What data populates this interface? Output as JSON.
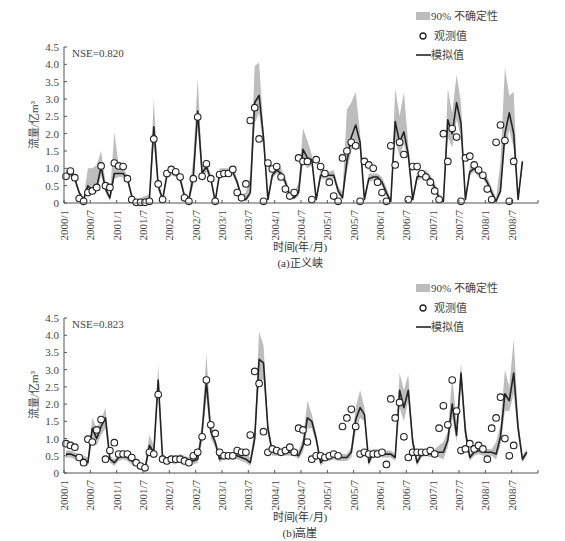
{
  "legend": {
    "band_label": "90%  不确定性",
    "observed_label": "观测值",
    "simulated_label": "模拟值"
  },
  "colors": {
    "band": "#bdbdbd",
    "line": "#222222",
    "marker_edge": "#222222",
    "marker_fill": "#ffffff",
    "axis": "#555555"
  },
  "chart_data": [
    {
      "type": "line",
      "title": "(a)正义峡",
      "caption": "(a)正义峡",
      "annotation": "NSE=0.820",
      "xlabel": "时间(年/月)",
      "ylabel": "流量/亿m³",
      "ylim": [
        0,
        4.5
      ],
      "yticks": [
        "0",
        "0.5",
        "1.0",
        "1.5",
        "2.0",
        "2.5",
        "3.0",
        "3.5",
        "4.0",
        "4.5"
      ],
      "xticks": [
        "2000/1",
        "2000/7",
        "2001/1",
        "2001/7",
        "2002/1",
        "2002/7",
        "2003/1",
        "2003/7",
        "2004/1",
        "2004/7",
        "2005/1",
        "2005/7",
        "2006/1",
        "2006/7",
        "2007/1",
        "2007/7",
        "2008/1",
        "2008/7"
      ],
      "grid": false,
      "legend_position": "top-right",
      "series": [
        {
          "name": "模拟值",
          "values": [
            0.8,
            0.85,
            0.7,
            0.3,
            0.1,
            0.5,
            0.35,
            0.45,
            1.05,
            0.4,
            0.15,
            0.85,
            0.85,
            0.85,
            0.7,
            0.2,
            0.05,
            0.05,
            0.1,
            0.1,
            2.2,
            0.5,
            0.1,
            0.8,
            0.9,
            0.85,
            0.7,
            0.2,
            0.1,
            0.75,
            2.65,
            0.85,
            1.05,
            0.7,
            0.05,
            0.85,
            0.85,
            0.85,
            0.9,
            0.6,
            0.15,
            0.1,
            0.3,
            2.9,
            3.1,
            1.9,
            0.1,
            0.8,
            0.95,
            0.85,
            0.6,
            0.2,
            0.15,
            0.3,
            1.55,
            1.3,
            1.25,
            0.1,
            0.8,
            0.8,
            0.8,
            0.8,
            0.35,
            0.15,
            1.2,
            1.9,
            2.25,
            1.75,
            0.1,
            0.7,
            0.75,
            0.75,
            0.6,
            0.3,
            0.05,
            2.35,
            1.75,
            2.05,
            1.4,
            0.1,
            0.75,
            0.8,
            0.85,
            0.7,
            0.45,
            0.15,
            0.05,
            2.4,
            2.0,
            2.9,
            2.3,
            0.1,
            0.9,
            1.0,
            0.85,
            0.8,
            0.6,
            0.3,
            0.05,
            0.35,
            2.0,
            2.6,
            2.0,
            0.1,
            1.2
          ]
        },
        {
          "name": "观测值",
          "values": [
            0.77,
            0.92,
            0.73,
            0.13,
            0.05,
            0.3,
            0.35,
            0.45,
            1.07,
            0.5,
            0.45,
            1.15,
            1.07,
            1.05,
            0.7,
            0.1,
            0.02,
            0.02,
            0.02,
            0.05,
            1.85,
            0.55,
            0.1,
            0.85,
            0.97,
            0.9,
            0.75,
            0.15,
            0.05,
            0.7,
            2.48,
            0.77,
            1.13,
            0.7,
            0.05,
            0.82,
            0.85,
            0.85,
            0.97,
            0.3,
            0.15,
            0.55,
            2.38,
            2.75,
            1.85,
            0.05,
            1.15,
            0.98,
            1.05,
            0.75,
            0.4,
            0.2,
            0.3,
            1.3,
            1.2,
            1.2,
            0.1,
            1.25,
            1.05,
            0.85,
            0.6,
            0.2,
            0.05,
            1.3,
            1.5,
            1.75,
            1.65,
            0.05,
            1.2,
            1.1,
            1.0,
            0.6,
            0.3,
            0.05,
            1.65,
            1.1,
            1.75,
            1.4,
            0.1,
            1.05,
            1.05,
            0.85,
            0.75,
            0.6,
            0.35,
            0.1,
            2.0,
            1.2,
            2.15,
            1.9,
            0.05,
            1.3,
            1.35,
            1.1,
            0.95,
            0.8,
            0.4,
            0.1,
            1.75,
            2.25,
            1.8,
            0.05,
            1.2
          ]
        },
        {
          "name": "90% 不确定性 (upper)",
          "values": [
            0.95,
            1.0,
            0.8,
            0.35,
            0.15,
            1.0,
            1.0,
            1.1,
            1.5,
            0.6,
            0.2,
            2.05,
            1.1,
            1.0,
            0.8,
            0.25,
            0.1,
            0.15,
            0.2,
            0.25,
            3.0,
            0.7,
            0.15,
            0.95,
            1.05,
            1.0,
            0.85,
            0.3,
            0.2,
            1.3,
            3.6,
            1.1,
            1.2,
            0.8,
            0.1,
            1.0,
            1.0,
            1.0,
            1.05,
            0.7,
            0.25,
            0.3,
            0.8,
            3.95,
            4.05,
            2.1,
            0.15,
            0.95,
            1.05,
            1.0,
            0.75,
            0.35,
            0.3,
            0.6,
            2.15,
            1.8,
            1.4,
            0.15,
            1.0,
            0.95,
            0.9,
            0.95,
            0.5,
            0.3,
            2.7,
            2.9,
            3.2,
            2.0,
            0.15,
            0.85,
            0.85,
            0.85,
            0.75,
            0.45,
            0.1,
            3.3,
            2.5,
            3.2,
            1.7,
            0.15,
            0.9,
            0.9,
            0.95,
            0.8,
            0.6,
            0.25,
            0.15,
            3.3,
            2.6,
            3.7,
            2.9,
            0.15,
            1.05,
            1.1,
            0.95,
            0.9,
            0.75,
            0.45,
            0.15,
            1.2,
            3.9,
            3.1,
            3.2,
            0.15,
            1.3
          ]
        },
        {
          "name": "90% 不确定性 (lower)",
          "values": [
            0.7,
            0.75,
            0.6,
            0.2,
            0.05,
            0.3,
            0.25,
            0.3,
            0.8,
            0.3,
            0.05,
            0.7,
            0.75,
            0.75,
            0.6,
            0.1,
            0.0,
            0.0,
            0.02,
            0.02,
            1.7,
            0.35,
            0.05,
            0.7,
            0.8,
            0.75,
            0.6,
            0.1,
            0.05,
            0.5,
            2.2,
            0.7,
            0.9,
            0.6,
            0.02,
            0.75,
            0.75,
            0.75,
            0.8,
            0.5,
            0.1,
            0.05,
            0.2,
            2.3,
            2.6,
            1.6,
            0.05,
            0.7,
            0.85,
            0.75,
            0.5,
            0.15,
            0.1,
            0.2,
            1.2,
            1.0,
            1.1,
            0.05,
            0.7,
            0.7,
            0.7,
            0.7,
            0.25,
            0.1,
            0.9,
            1.5,
            1.8,
            1.5,
            0.05,
            0.6,
            0.65,
            0.65,
            0.5,
            0.2,
            0.02,
            1.8,
            1.35,
            1.7,
            1.2,
            0.05,
            0.65,
            0.7,
            0.75,
            0.6,
            0.35,
            0.1,
            0.02,
            1.9,
            1.6,
            2.4,
            1.9,
            0.05,
            0.8,
            0.9,
            0.75,
            0.7,
            0.5,
            0.2,
            0.02,
            0.25,
            1.6,
            2.1,
            1.6,
            0.05,
            1.0
          ]
        }
      ]
    },
    {
      "type": "line",
      "title": "(b)高崖",
      "caption": "(b)高崖",
      "annotation": "NSE=0.823",
      "xlabel": "时间(年/月)",
      "ylabel": "流量/亿m³",
      "ylim": [
        0,
        4.5
      ],
      "yticks": [
        "0",
        "0.5",
        "1.0",
        "1.5",
        "2.0",
        "2.5",
        "3.0",
        "3.5",
        "4.0",
        "4.5"
      ],
      "xticks": [
        "2000/1",
        "2000/7",
        "2001/1",
        "2001/7",
        "2002/1",
        "2002/7",
        "2003/1",
        "2003/7",
        "2004/1",
        "2004/7",
        "2005/1",
        "2005/7",
        "2006/1",
        "2006/7",
        "2007/1",
        "2007/7",
        "2008/1",
        "2008/7"
      ],
      "grid": false,
      "legend_position": "top-right",
      "series": [
        {
          "name": "模拟值",
          "values": [
            0.55,
            0.55,
            0.5,
            0.45,
            0.4,
            0.3,
            1.3,
            1.0,
            1.35,
            1.6,
            0.4,
            0.3,
            0.45,
            0.5,
            0.45,
            0.35,
            0.3,
            0.2,
            0.1,
            0.8,
            0.6,
            2.7,
            0.4,
            0.35,
            0.4,
            0.35,
            0.45,
            0.4,
            0.35,
            0.35,
            0.4,
            1.2,
            2.65,
            1.2,
            0.9,
            0.4,
            0.5,
            0.5,
            0.55,
            0.5,
            0.45,
            0.4,
            0.3,
            1.0,
            3.3,
            3.2,
            1.3,
            0.6,
            0.6,
            0.6,
            0.6,
            0.6,
            0.6,
            0.5,
            0.8,
            1.6,
            1.5,
            1.0,
            0.3,
            0.45,
            0.45,
            0.5,
            0.45,
            0.45,
            0.45,
            0.6,
            1.55,
            1.9,
            1.7,
            0.3,
            0.6,
            0.6,
            0.55,
            0.55,
            0.55,
            0.45,
            2.4,
            1.9,
            2.4,
            0.9,
            0.3,
            0.55,
            0.6,
            0.55,
            0.6,
            0.6,
            0.6,
            0.95,
            2.0,
            1.1,
            2.9,
            1.2,
            0.45,
            0.6,
            0.65,
            0.6,
            0.6,
            0.6,
            0.55,
            1.05,
            2.3,
            2.1,
            2.9,
            1.3,
            0.4,
            0.6
          ]
        },
        {
          "name": "观测值",
          "values": [
            0.85,
            0.8,
            0.75,
            0.45,
            0.3,
            0.98,
            0.9,
            1.25,
            1.55,
            0.4,
            0.65,
            0.88,
            0.55,
            0.55,
            0.55,
            0.45,
            0.3,
            0.2,
            0.15,
            0.6,
            0.55,
            2.28,
            0.4,
            0.35,
            0.4,
            0.4,
            0.4,
            0.35,
            0.3,
            0.5,
            0.6,
            1.05,
            2.7,
            1.4,
            1.15,
            0.6,
            0.5,
            0.5,
            0.5,
            0.65,
            0.6,
            0.6,
            1.1,
            2.95,
            2.6,
            1.2,
            0.6,
            0.7,
            0.65,
            0.6,
            0.65,
            0.75,
            0.6,
            1.3,
            1.25,
            0.9,
            0.4,
            0.5,
            0.5,
            0.45,
            0.5,
            0.55,
            0.5,
            1.35,
            1.6,
            1.85,
            1.35,
            0.55,
            0.6,
            0.55,
            0.55,
            0.55,
            0.6,
            0.25,
            2.15,
            1.6,
            2.05,
            1.05,
            0.45,
            0.6,
            0.6,
            0.6,
            0.6,
            0.65,
            0.55,
            1.3,
            1.95,
            1.4,
            2.7,
            1.8,
            0.65,
            0.7,
            0.85,
            0.7,
            0.8,
            0.7,
            0.4,
            1.3,
            1.6,
            2.2,
            1.0,
            0.5,
            0.8
          ]
        },
        {
          "name": "90% 不确定性 (upper)",
          "values": [
            0.65,
            0.65,
            0.6,
            0.55,
            0.5,
            0.45,
            1.6,
            1.3,
            1.55,
            1.9,
            0.5,
            0.4,
            0.55,
            0.55,
            0.5,
            0.45,
            0.4,
            0.3,
            0.25,
            1.1,
            0.8,
            3.15,
            0.55,
            0.45,
            0.5,
            0.45,
            0.55,
            0.5,
            0.45,
            0.45,
            0.55,
            1.5,
            3.45,
            1.5,
            1.0,
            0.5,
            0.6,
            0.6,
            0.6,
            0.6,
            0.55,
            0.55,
            0.45,
            1.3,
            4.1,
            3.7,
            1.5,
            0.7,
            0.7,
            0.7,
            0.7,
            0.7,
            0.7,
            0.65,
            1.0,
            2.1,
            1.7,
            1.15,
            0.4,
            0.55,
            0.55,
            0.6,
            0.55,
            0.55,
            0.55,
            0.75,
            1.9,
            2.4,
            1.9,
            0.4,
            0.7,
            0.7,
            0.65,
            0.65,
            0.65,
            0.55,
            2.9,
            2.4,
            2.85,
            1.1,
            0.4,
            0.65,
            0.7,
            0.65,
            0.7,
            0.8,
            0.9,
            1.2,
            2.8,
            1.5,
            3.2,
            1.5,
            0.55,
            0.7,
            0.75,
            0.7,
            0.7,
            0.7,
            0.9,
            1.4,
            3.0,
            2.5,
            3.9,
            1.6,
            0.5,
            0.7
          ]
        },
        {
          "name": "90% 不确定性 (lower)",
          "values": [
            0.45,
            0.45,
            0.4,
            0.35,
            0.3,
            0.2,
            1.0,
            0.8,
            1.1,
            1.3,
            0.3,
            0.2,
            0.35,
            0.4,
            0.35,
            0.25,
            0.2,
            0.1,
            0.05,
            0.6,
            0.45,
            2.3,
            0.3,
            0.25,
            0.3,
            0.25,
            0.35,
            0.3,
            0.25,
            0.25,
            0.3,
            0.9,
            2.2,
            1.0,
            0.75,
            0.3,
            0.4,
            0.4,
            0.45,
            0.4,
            0.35,
            0.3,
            0.2,
            0.8,
            2.7,
            2.7,
            1.1,
            0.5,
            0.5,
            0.5,
            0.5,
            0.5,
            0.5,
            0.4,
            0.6,
            1.3,
            1.3,
            0.85,
            0.2,
            0.35,
            0.35,
            0.4,
            0.35,
            0.35,
            0.35,
            0.45,
            1.2,
            1.6,
            1.5,
            0.2,
            0.5,
            0.5,
            0.45,
            0.45,
            0.45,
            0.35,
            1.9,
            1.5,
            2.1,
            0.75,
            0.2,
            0.45,
            0.5,
            0.45,
            0.5,
            0.45,
            0.4,
            0.75,
            1.6,
            0.9,
            2.5,
            1.0,
            0.35,
            0.5,
            0.55,
            0.5,
            0.5,
            0.5,
            0.4,
            0.8,
            1.8,
            1.8,
            2.3,
            1.1,
            0.3,
            0.5
          ]
        }
      ]
    }
  ]
}
